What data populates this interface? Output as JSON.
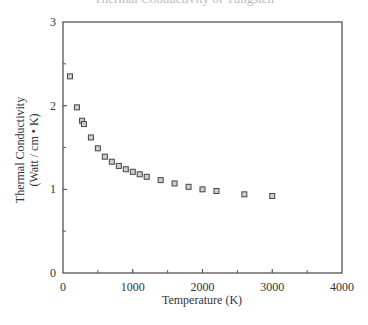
{
  "cut_title": "Thermal Conductivity of Tungsten",
  "chart_data": {
    "type": "scatter",
    "title": "",
    "xlabel": "Temperature (K)",
    "ylabel": [
      "Thermal Conductivity",
      "(Watt / cm • K)"
    ],
    "xlim": [
      0,
      4000
    ],
    "ylim": [
      0,
      3
    ],
    "xticks": [
      0,
      1000,
      2000,
      3000,
      4000
    ],
    "yticks": [
      0,
      1,
      2,
      3
    ],
    "x_minor_ticks": [
      500,
      1500,
      2500,
      3500
    ],
    "y_minor_ticks": [
      0.5,
      1.5,
      2.5
    ],
    "grid": false,
    "legend": null,
    "marker": "open-square",
    "series": [
      {
        "name": "Thermal Conductivity",
        "x": [
          100,
          200,
          273,
          300,
          400,
          500,
          600,
          700,
          800,
          900,
          1000,
          1100,
          1200,
          1400,
          1600,
          1800,
          2000,
          2200,
          2600,
          3000
        ],
        "y": [
          2.35,
          1.98,
          1.82,
          1.78,
          1.62,
          1.49,
          1.39,
          1.33,
          1.28,
          1.24,
          1.21,
          1.18,
          1.15,
          1.11,
          1.07,
          1.03,
          1.0,
          0.98,
          0.94,
          0.92
        ]
      }
    ]
  }
}
